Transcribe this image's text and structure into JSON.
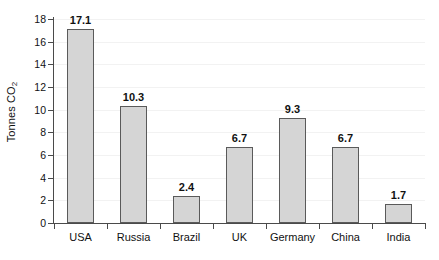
{
  "chart_data": {
    "type": "bar",
    "title": "",
    "subtitle": "",
    "xlabel": "",
    "ylabel": "Tonnes CO2",
    "ylabel_parts": {
      "text": "Tonnes CO",
      "subscript": "2"
    },
    "categories": [
      "USA",
      "Russia",
      "Brazil",
      "UK",
      "Germany",
      "China",
      "India"
    ],
    "values": [
      17.1,
      10.3,
      2.4,
      6.7,
      9.3,
      6.7,
      1.7
    ],
    "value_labels": [
      "17.1",
      "10.3",
      "2.4",
      "6.7",
      "9.3",
      "6.7",
      "1.7"
    ],
    "ylim": [
      0,
      18
    ],
    "ytick_values": [
      0,
      2,
      4,
      6,
      8,
      10,
      12,
      14,
      16,
      18
    ],
    "ytick_labels": [
      "0",
      "2",
      "4",
      "6",
      "8",
      "10",
      "12",
      "14",
      "16",
      "18"
    ],
    "grid": true,
    "grid_axis": "y",
    "legend": false,
    "legend_position": "none",
    "bar_fill_color": "#d5d5d5",
    "bar_border_color": "#5a5a5a",
    "axis_color": "#4a4a4a",
    "gridline_color": "#f2f2f2",
    "text_color": "#111111",
    "background_color": "#ffffff"
  }
}
